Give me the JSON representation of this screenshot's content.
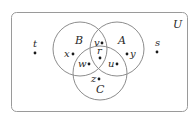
{
  "diagram": {
    "type": "venn",
    "universe": {
      "label": "U",
      "label_pos": [
        173,
        28
      ]
    },
    "sets": [
      {
        "name": "A",
        "label": "A",
        "cx": 117,
        "cy": 49,
        "r": 27,
        "label_pos": [
          118,
          44
        ]
      },
      {
        "name": "B",
        "label": "B",
        "cx": 80,
        "cy": 49,
        "r": 27,
        "label_pos": [
          75,
          44
        ]
      },
      {
        "name": "C",
        "label": "C",
        "cx": 100,
        "cy": 73,
        "r": 27,
        "label_pos": [
          96,
          93
        ]
      }
    ],
    "points": [
      {
        "label": "t",
        "region": "outside",
        "dot": [
          35,
          53
        ],
        "label_pos": [
          33,
          47
        ]
      },
      {
        "label": "s",
        "region": "outside",
        "dot": [
          157,
          52
        ],
        "label_pos": [
          155,
          46
        ]
      },
      {
        "label": "x",
        "region": "B only",
        "dot": [
          73,
          54
        ],
        "label_pos": [
          64,
          57
        ]
      },
      {
        "label": "y",
        "region": "A only",
        "dot": [
          127,
          54
        ],
        "label_pos": [
          130,
          57
        ]
      },
      {
        "label": "v",
        "region": "A∩B only",
        "dot": [
          102,
          43
        ],
        "label_pos": [
          94,
          46
        ]
      },
      {
        "label": "r",
        "region": "A∩B∩C",
        "dot": [
          100,
          58
        ],
        "label_pos": [
          97,
          54
        ]
      },
      {
        "label": "w",
        "region": "B∩C only",
        "dot": [
          89,
          64
        ],
        "label_pos": [
          78,
          67
        ]
      },
      {
        "label": "u",
        "region": "A∩C only",
        "dot": [
          117,
          64
        ],
        "label_pos": [
          108,
          67
        ]
      },
      {
        "label": "z",
        "region": "C only",
        "dot": [
          99,
          79
        ],
        "label_pos": [
          91,
          82
        ]
      }
    ]
  }
}
